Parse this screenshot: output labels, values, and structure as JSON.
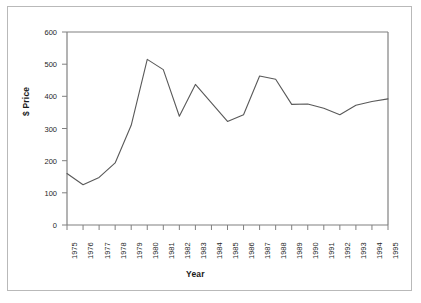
{
  "figure": {
    "background_color": "#ffffff",
    "frame_color": "#b9b9b9",
    "axis_color": "#808080",
    "line_color": "#595959"
  },
  "chart_data": {
    "type": "line",
    "title": "",
    "xlabel": "Year",
    "ylabel": "$ Price",
    "xlim": [
      1975,
      1995
    ],
    "ylim": [
      0,
      600
    ],
    "ytick_step": 100,
    "grid": false,
    "legend": "none",
    "x": [
      1975,
      1976,
      1977,
      1978,
      1979,
      1980,
      1981,
      1982,
      1983,
      1984,
      1985,
      1986,
      1987,
      1988,
      1989,
      1990,
      1991,
      1992,
      1993,
      1994,
      1995
    ],
    "categories": [
      "1975",
      "1976",
      "1977",
      "1978",
      "1979",
      "1980",
      "1981",
      "1982",
      "1983",
      "1984",
      "1985",
      "1986",
      "1987",
      "1988",
      "1989",
      "1990",
      "1991",
      "1992",
      "1993",
      "1994",
      "1995"
    ],
    "values": [
      160,
      125,
      148,
      193,
      310,
      515,
      483,
      338,
      437,
      380,
      322,
      343,
      463,
      453,
      375,
      376,
      363,
      343,
      372,
      384,
      392
    ],
    "series": [
      {
        "name": "$ Price",
        "values": [
          160,
          125,
          148,
          193,
          310,
          515,
          483,
          338,
          437,
          380,
          322,
          343,
          463,
          453,
          375,
          376,
          363,
          343,
          372,
          384,
          392
        ]
      }
    ],
    "yticks": [
      0,
      100,
      200,
      300,
      400,
      500,
      600
    ],
    "ytick_labels": [
      "0",
      "100",
      "200",
      "300",
      "400",
      "500",
      "600"
    ],
    "xtick_labels": [
      "1975",
      "1976",
      "1977",
      "1978",
      "1979",
      "1980",
      "1981",
      "1982",
      "1983",
      "1984",
      "1985",
      "1986",
      "1987",
      "1988",
      "1989",
      "1990",
      "1991",
      "1992",
      "1993",
      "1994",
      "1995"
    ]
  }
}
